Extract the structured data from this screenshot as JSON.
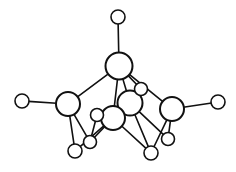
{
  "figure": {
    "kind": "chemical-structure",
    "background_color": "#ffffff",
    "line_color": "#111111",
    "atom_fill_color": "#ffffff",
    "canvas": {
      "width": 236,
      "height": 172
    },
    "atom_counts": {
      "large": 5,
      "small": 9,
      "total": 14
    }
  },
  "chart_data": {
    "type": "scatter",
    "xlabel": "",
    "ylabel": "",
    "xlim": [
      0,
      236
    ],
    "ylim": [
      0,
      172
    ],
    "grid": false,
    "legend": "none",
    "atoms": [
      {
        "id": "a1",
        "role": "terminal-top",
        "size": "small",
        "x": 118,
        "y": 17,
        "r": 7,
        "stroke": 1.6
      },
      {
        "id": "a2",
        "role": "apex-center",
        "size": "large",
        "x": 119,
        "y": 66,
        "r": 13.5,
        "stroke": 2.0
      },
      {
        "id": "a3",
        "role": "terminal-left",
        "size": "small",
        "x": 22,
        "y": 101,
        "r": 7,
        "stroke": 1.6
      },
      {
        "id": "a4",
        "role": "node-left",
        "size": "large",
        "x": 68,
        "y": 104,
        "r": 12,
        "stroke": 2.0
      },
      {
        "id": "a5",
        "role": "terminal-right",
        "size": "small",
        "x": 218,
        "y": 102,
        "r": 7,
        "stroke": 1.6
      },
      {
        "id": "a6",
        "role": "node-right",
        "size": "large",
        "x": 172,
        "y": 109,
        "r": 12,
        "stroke": 2.0
      },
      {
        "id": "a7",
        "role": "node-center-back",
        "size": "large",
        "x": 130,
        "y": 103,
        "r": 12.5,
        "stroke": 2.0
      },
      {
        "id": "a8",
        "role": "node-center-front",
        "size": "large",
        "x": 113,
        "y": 118,
        "r": 12,
        "stroke": 2.0
      },
      {
        "id": "a9",
        "role": "terminal-center-upper",
        "size": "small",
        "x": 141,
        "y": 89,
        "r": 6.5,
        "stroke": 1.6
      },
      {
        "id": "a10",
        "role": "terminal-center-left",
        "size": "small",
        "x": 97,
        "y": 115,
        "r": 6.5,
        "stroke": 1.6
      },
      {
        "id": "a11",
        "role": "terminal-bottom-left",
        "size": "small",
        "x": 75,
        "y": 151,
        "r": 7,
        "stroke": 1.6
      },
      {
        "id": "a12",
        "role": "terminal-lower-left",
        "size": "small",
        "x": 90,
        "y": 142,
        "r": 6.5,
        "stroke": 1.6
      },
      {
        "id": "a13",
        "role": "terminal-bottom-mid",
        "size": "small",
        "x": 151,
        "y": 153,
        "r": 7,
        "stroke": 1.6
      },
      {
        "id": "a14",
        "role": "terminal-lower-right",
        "size": "small",
        "x": 168,
        "y": 139,
        "r": 6.5,
        "stroke": 1.6
      }
    ],
    "bonds": [
      {
        "from": "a1",
        "to": "a2",
        "width": 1.6
      },
      {
        "from": "a2",
        "to": "a4",
        "width": 1.6
      },
      {
        "from": "a2",
        "to": "a6",
        "width": 1.6
      },
      {
        "from": "a2",
        "to": "a7",
        "width": 1.6
      },
      {
        "from": "a2",
        "to": "a8",
        "width": 1.6
      },
      {
        "from": "a2",
        "to": "a9",
        "width": 1.6
      },
      {
        "from": "a3",
        "to": "a4",
        "width": 1.6
      },
      {
        "from": "a4",
        "to": "a11",
        "width": 1.6
      },
      {
        "from": "a4",
        "to": "a12",
        "width": 1.6
      },
      {
        "from": "a5",
        "to": "a6",
        "width": 1.6
      },
      {
        "from": "a6",
        "to": "a13",
        "width": 1.6
      },
      {
        "from": "a6",
        "to": "a14",
        "width": 1.6
      },
      {
        "from": "a7",
        "to": "a9",
        "width": 1.6
      },
      {
        "from": "a7",
        "to": "a13",
        "width": 1.6
      },
      {
        "from": "a7",
        "to": "a14",
        "width": 1.6
      },
      {
        "from": "a8",
        "to": "a10",
        "width": 1.6
      },
      {
        "from": "a8",
        "to": "a11",
        "width": 1.6
      },
      {
        "from": "a8",
        "to": "a12",
        "width": 1.6
      },
      {
        "from": "a8",
        "to": "a13",
        "width": 1.6
      },
      {
        "from": "a10",
        "to": "a12",
        "width": 1.6
      }
    ]
  }
}
